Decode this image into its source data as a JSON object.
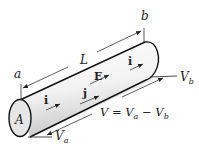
{
  "diagram": {
    "type": "cylindrical-conductor",
    "labels": {
      "end_a": "a",
      "end_b": "b",
      "length": "L",
      "area": "A",
      "field": "E",
      "current_1": "i",
      "current_2": "i",
      "current_density": "j",
      "potential_b": "V",
      "potential_b_sub": "b",
      "potential_a": "V",
      "potential_a_sub": "a",
      "equation_V": "V",
      "equation_eq": " = ",
      "equation_Va": "V",
      "equation_Va_sub": "a",
      "equation_minus": " − ",
      "equation_Vb": "V",
      "equation_Vb_sub": "b"
    },
    "colors": {
      "stroke": "#111111",
      "fill_light": "#ffffff",
      "fill_shade": "#cfcfcf",
      "text": "#222222"
    }
  }
}
